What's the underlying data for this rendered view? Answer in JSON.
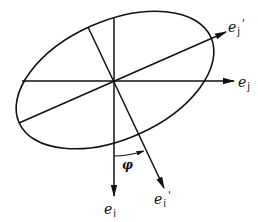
{
  "diagram": {
    "type": "rotated-ellipse-axes",
    "stroke_color": "#111111",
    "background": "#ffffff",
    "center": [
      114,
      81
    ],
    "ellipse": {
      "rx": 105,
      "ry": 60,
      "rotation_deg": -24
    },
    "labels": {
      "ej": {
        "base": "e",
        "sub": "j",
        "prime": ""
      },
      "ej_prime": {
        "base": "e",
        "sub": "j",
        "prime": "'"
      },
      "ei": {
        "base": "e",
        "sub": "i",
        "prime": ""
      },
      "ei_prime": {
        "base": "e",
        "sub": "i",
        "prime": "'"
      },
      "phi": "φ"
    },
    "vectors": [
      {
        "name": "e_j",
        "from": [
          22,
          81
        ],
        "to": [
          234,
          81
        ]
      },
      {
        "name": "e_j'",
        "from": [
          19,
          123
        ],
        "to": [
          225,
          32
        ]
      },
      {
        "name": "e_i",
        "from": [
          114,
          18
        ],
        "to": [
          114,
          195
        ]
      },
      {
        "name": "e_i'",
        "from": [
          88,
          27
        ],
        "to": [
          164,
          187
        ]
      }
    ],
    "angle_arc": {
      "label": "φ",
      "from_vector": "e_i",
      "to_vector": "e_i'",
      "radius": 75
    }
  }
}
